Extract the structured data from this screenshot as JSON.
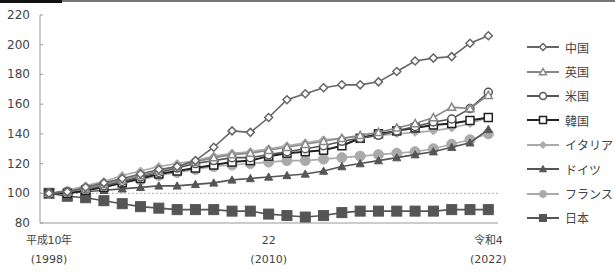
{
  "chart_data": {
    "type": "line",
    "title": "",
    "xlabel": "",
    "ylabel": "",
    "ylim": [
      80,
      220
    ],
    "yticks": [
      80,
      100,
      120,
      140,
      160,
      180,
      200,
      220
    ],
    "baseline_reference": 100,
    "grid": false,
    "legend_position": "right",
    "x": [
      1998,
      1999,
      2000,
      2001,
      2002,
      2003,
      2004,
      2005,
      2006,
      2007,
      2008,
      2009,
      2010,
      2011,
      2012,
      2013,
      2014,
      2015,
      2016,
      2017,
      2018,
      2019,
      2020,
      2021,
      2022
    ],
    "x_tick_labels": [
      {
        "x": 1998,
        "line1": "平成10年",
        "line2": "(1998)"
      },
      {
        "x": 2010,
        "line1": "22",
        "line2": "(2010)"
      },
      {
        "x": 2022,
        "line1": "令和4",
        "line2": "(2022)"
      }
    ],
    "series": [
      {
        "name": "中国",
        "marker": "diamond-open",
        "color": "#666666",
        "values": [
          100,
          101,
          104,
          107,
          110,
          113,
          116,
          118,
          122,
          131,
          142,
          141,
          151,
          163,
          167,
          171,
          173,
          173,
          175,
          182,
          189,
          191,
          192,
          201,
          206
        ]
      },
      {
        "name": "英国",
        "marker": "triangle-open",
        "color": "#888888",
        "values": [
          100,
          101,
          103,
          106,
          109,
          112,
          115,
          118,
          121,
          124,
          126,
          127,
          129,
          131,
          133,
          135,
          137,
          139,
          141,
          144,
          147,
          151,
          158,
          157,
          166
        ]
      },
      {
        "name": "米国",
        "marker": "circle-open",
        "color": "#555555",
        "values": [
          100,
          101,
          103,
          105,
          108,
          111,
          114,
          117,
          120,
          122,
          124,
          124,
          126,
          128,
          130,
          132,
          135,
          137,
          139,
          142,
          145,
          148,
          150,
          157,
          168
        ]
      },
      {
        "name": "韓国",
        "marker": "square-open",
        "color": "#222222",
        "values": [
          100,
          100,
          102,
          104,
          107,
          110,
          113,
          115,
          117,
          119,
          121,
          122,
          125,
          127,
          128,
          129,
          132,
          137,
          140,
          142,
          144,
          146,
          147,
          149,
          151
        ]
      },
      {
        "name": "イタリア",
        "marker": "diamond-filled",
        "color": "#aaaaaa",
        "values": [
          100,
          102,
          105,
          108,
          112,
          115,
          118,
          120,
          122,
          125,
          127,
          128,
          130,
          132,
          134,
          136,
          137,
          138,
          139,
          140,
          141,
          142,
          144,
          147,
          151
        ]
      },
      {
        "name": "ドイツ",
        "marker": "triangle-filled",
        "color": "#555555",
        "values": [
          100,
          100,
          101,
          102,
          103,
          104,
          105,
          105,
          106,
          107,
          109,
          110,
          111,
          112,
          113,
          115,
          118,
          120,
          122,
          124,
          126,
          128,
          131,
          134,
          143
        ]
      },
      {
        "name": "フランス",
        "marker": "circle-filled",
        "color": "#aaaaaa",
        "values": [
          100,
          101,
          103,
          105,
          107,
          109,
          112,
          114,
          116,
          118,
          119,
          120,
          121,
          122,
          122,
          123,
          124,
          125,
          126,
          127,
          128,
          130,
          133,
          136,
          140
        ]
      },
      {
        "name": "日本",
        "marker": "square-filled",
        "color": "#555555",
        "values": [
          100,
          98,
          97,
          95,
          93,
          91,
          90,
          89,
          89,
          89,
          88,
          88,
          86,
          85,
          84,
          85,
          87,
          88,
          88,
          88,
          88,
          88,
          89,
          89,
          89
        ]
      }
    ]
  },
  "legend": {
    "items": [
      {
        "label": "中国"
      },
      {
        "label": "英国"
      },
      {
        "label": "米国"
      },
      {
        "label": "韓国"
      },
      {
        "label": "イタリア"
      },
      {
        "label": "ドイツ"
      },
      {
        "label": "フランス"
      },
      {
        "label": "日本"
      }
    ]
  },
  "axis": {
    "y_labels": [
      "220",
      "200",
      "180",
      "160",
      "140",
      "120",
      "100",
      "80"
    ],
    "x_labels": [
      {
        "line1": "平成10年",
        "line2": "(1998)"
      },
      {
        "line1": "22",
        "line2": "(2010)"
      },
      {
        "line1": "令和4",
        "line2": "(2022)"
      }
    ]
  }
}
